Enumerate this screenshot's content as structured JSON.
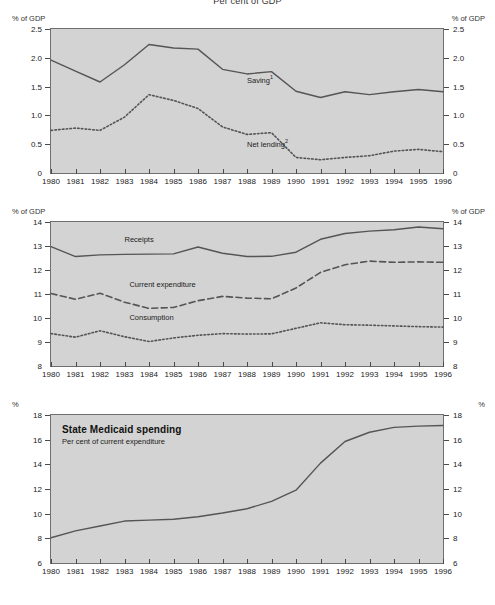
{
  "title": "Per cent of GDP",
  "chart_data": [
    {
      "type": "line",
      "panel": 1,
      "title": "",
      "xlabel": "",
      "ylabel": "% of GDP",
      "unit_left": "% of GDP",
      "unit_right": "% of GDP",
      "grid": false,
      "legend_position": "inline",
      "x": [
        1980,
        1981,
        1982,
        1983,
        1984,
        1985,
        1986,
        1987,
        1988,
        1989,
        1990,
        1991,
        1992,
        1993,
        1994,
        1995,
        1996
      ],
      "xlim": [
        1980,
        1996
      ],
      "ylim": [
        0,
        2.5
      ],
      "yticks": [
        "0",
        "0.5",
        "1.0",
        "1.5",
        "2.0",
        "2.5"
      ],
      "ytick_values": [
        0,
        0.5,
        1.0,
        1.5,
        2.0,
        2.5
      ],
      "xtick_labels": [
        "1980",
        "1981",
        "1982",
        "1983",
        "1984",
        "1985",
        "1986",
        "1987",
        "1988",
        "1989",
        "1990",
        "1991",
        "1992",
        "1993",
        "1994",
        "1995",
        "1996"
      ],
      "series": [
        {
          "name": "Saving",
          "footnote": "1",
          "style": "solid",
          "label_x": 1988.0,
          "label_y": 1.62,
          "values": [
            1.96,
            1.77,
            1.58,
            1.88,
            2.23,
            2.17,
            2.15,
            1.8,
            1.72,
            1.76,
            1.42,
            1.31,
            1.41,
            1.36,
            1.41,
            1.45,
            1.41
          ]
        },
        {
          "name": "Net lending",
          "footnote": "2",
          "style": "dotted",
          "label_x": 1988.0,
          "label_y": 0.5,
          "values": [
            0.74,
            0.78,
            0.74,
            0.97,
            1.36,
            1.26,
            1.12,
            0.8,
            0.67,
            0.7,
            0.27,
            0.23,
            0.27,
            0.3,
            0.38,
            0.41,
            0.37
          ]
        }
      ]
    },
    {
      "type": "line",
      "panel": 2,
      "title": "",
      "xlabel": "",
      "ylabel": "% of GDP",
      "unit_left": "% of GDP",
      "unit_right": "% of GDP",
      "grid": false,
      "legend_position": "inline",
      "x": [
        1980,
        1981,
        1982,
        1983,
        1984,
        1985,
        1986,
        1987,
        1988,
        1989,
        1990,
        1991,
        1992,
        1993,
        1994,
        1995,
        1996
      ],
      "xlim": [
        1980,
        1996
      ],
      "ylim": [
        8,
        14
      ],
      "yticks": [
        "8",
        "9",
        "10",
        "11",
        "12",
        "13",
        "14"
      ],
      "ytick_values": [
        8,
        9,
        10,
        11,
        12,
        13,
        14
      ],
      "xtick_labels": [
        "1980",
        "1981",
        "1982",
        "1983",
        "1984",
        "1985",
        "1986",
        "1987",
        "1988",
        "1989",
        "1990",
        "1991",
        "1992",
        "1993",
        "1994",
        "1995",
        "1996"
      ],
      "series": [
        {
          "name": "Receipts",
          "footnote": "",
          "style": "solid",
          "label_x": 1983.0,
          "label_y": 13.22,
          "values": [
            12.97,
            12.56,
            12.63,
            12.65,
            12.66,
            12.67,
            12.96,
            12.7,
            12.56,
            12.57,
            12.74,
            13.28,
            13.52,
            13.62,
            13.68,
            13.79,
            13.72
          ]
        },
        {
          "name": "Current expenditure",
          "footnote": "",
          "style": "dashed",
          "label_x": 1983.2,
          "label_y": 11.32,
          "values": [
            11.02,
            10.78,
            11.03,
            10.66,
            10.4,
            10.44,
            10.72,
            10.9,
            10.83,
            10.8,
            11.25,
            11.9,
            12.22,
            12.37,
            12.32,
            12.34,
            12.32
          ]
        },
        {
          "name": "Consumption",
          "footnote": "",
          "style": "dotted",
          "label_x": 1983.2,
          "label_y": 9.95,
          "values": [
            9.35,
            9.2,
            9.47,
            9.22,
            9.02,
            9.17,
            9.28,
            9.35,
            9.33,
            9.34,
            9.57,
            9.8,
            9.72,
            9.7,
            9.67,
            9.64,
            9.62
          ]
        }
      ]
    },
    {
      "type": "line",
      "panel": 3,
      "title": "State Medicaid spending",
      "subtitle": "Per cent of current expenditure",
      "xlabel": "",
      "ylabel": "%",
      "unit_left": "%",
      "unit_right": "%",
      "grid": false,
      "legend_position": "inline",
      "x": [
        1980,
        1981,
        1982,
        1983,
        1984,
        1985,
        1986,
        1987,
        1988,
        1989,
        1990,
        1991,
        1992,
        1993,
        1994,
        1995,
        1996
      ],
      "xlim": [
        1980,
        1996
      ],
      "ylim": [
        6,
        18
      ],
      "yticks": [
        "6",
        "8",
        "10",
        "12",
        "14",
        "16",
        "18"
      ],
      "ytick_values": [
        6,
        8,
        10,
        12,
        14,
        16,
        18
      ],
      "xtick_labels": [
        "1980",
        "1981",
        "1982",
        "1983",
        "1984",
        "1985",
        "1986",
        "1987",
        "1988",
        "1989",
        "1990",
        "1991",
        "1992",
        "1993",
        "1994",
        "1995",
        "1996"
      ],
      "series": [
        {
          "name": "State Medicaid spending",
          "footnote": "",
          "style": "solid",
          "values": [
            8.05,
            8.6,
            9.0,
            9.4,
            9.48,
            9.55,
            9.75,
            10.05,
            10.4,
            11.0,
            11.9,
            14.1,
            15.85,
            16.6,
            17.0,
            17.1,
            17.15
          ]
        }
      ]
    }
  ],
  "colors": {
    "plot_background": "#d3d3d3",
    "plot_border": "#6f6f6f",
    "line": "#555555",
    "text": "#222222"
  }
}
